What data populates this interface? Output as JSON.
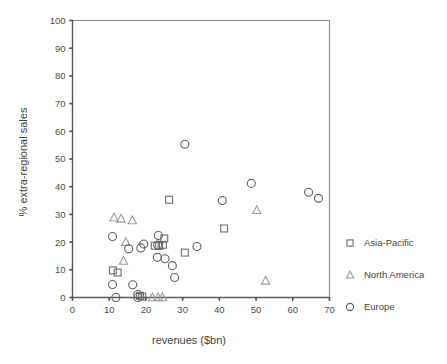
{
  "chart_data": {
    "type": "scatter",
    "title": "",
    "xlabel": "revenues ($bn)",
    "ylabel": "% extra-regional sales",
    "xlim": [
      0,
      70
    ],
    "ylim": [
      0,
      100
    ],
    "xticks": [
      0,
      10,
      20,
      30,
      40,
      50,
      60,
      70
    ],
    "yticks": [
      0,
      10,
      20,
      30,
      40,
      50,
      60,
      70,
      80,
      90,
      100
    ],
    "grid": false,
    "legend_position": "right",
    "series": [
      {
        "name": "Asia-Pacific",
        "marker": "square",
        "points": [
          [
            11.0,
            9.8
          ],
          [
            12.3,
            9.0
          ],
          [
            18.4,
            0.6
          ],
          [
            19.0,
            0.3
          ],
          [
            22.4,
            18.7
          ],
          [
            23.6,
            18.6
          ],
          [
            24.6,
            19.0
          ],
          [
            25.0,
            21.3
          ],
          [
            26.3,
            35.3
          ],
          [
            30.6,
            16.2
          ],
          [
            41.3,
            24.9
          ]
        ]
      },
      {
        "name": "North America",
        "marker": "triangle",
        "points": [
          [
            11.3,
            28.8
          ],
          [
            13.2,
            28.4
          ],
          [
            14.5,
            20.0
          ],
          [
            16.3,
            27.8
          ],
          [
            13.9,
            13.2
          ],
          [
            21.8,
            0.0
          ],
          [
            23.3,
            0.0
          ],
          [
            24.5,
            0.0
          ],
          [
            50.2,
            31.5
          ],
          [
            52.6,
            6.0
          ]
        ]
      },
      {
        "name": "Europe",
        "marker": "circle",
        "points": [
          [
            10.9,
            22.0
          ],
          [
            10.9,
            4.7
          ],
          [
            11.8,
            0.0
          ],
          [
            15.3,
            17.6
          ],
          [
            16.4,
            4.6
          ],
          [
            17.8,
            1.1
          ],
          [
            17.8,
            0.0
          ],
          [
            18.6,
            17.9
          ],
          [
            19.4,
            19.3
          ],
          [
            23.2,
            18.9
          ],
          [
            23.4,
            22.4
          ],
          [
            23.1,
            14.5
          ],
          [
            25.2,
            14.0
          ],
          [
            27.2,
            11.5
          ],
          [
            27.8,
            7.2
          ],
          [
            30.6,
            55.3
          ],
          [
            33.9,
            18.4
          ],
          [
            40.8,
            35.0
          ],
          [
            48.7,
            41.2
          ],
          [
            64.3,
            38.0
          ],
          [
            67.0,
            35.8
          ]
        ]
      }
    ]
  },
  "legend": {
    "entries": [
      {
        "label": "Asia-Pacific",
        "marker": "square"
      },
      {
        "label": "North America",
        "marker": "triangle"
      },
      {
        "label": "Europe",
        "marker": "circle"
      }
    ]
  },
  "axes": {
    "x_title": "revenues ($bn)",
    "y_title": "% extra-regional sales",
    "x_tick_labels": [
      "0",
      "10",
      "20",
      "30",
      "40",
      "50",
      "60",
      "70"
    ],
    "y_tick_labels": [
      "0",
      "10",
      "20",
      "30",
      "40",
      "50",
      "60",
      "70",
      "80",
      "90",
      "100"
    ]
  },
  "colors": {
    "axis": "#5a5a5a",
    "frame": "#8a8a8a",
    "marker_circle": "#5e5e5e",
    "marker_square": "#6b6b6b",
    "marker_triangle": "#9a9a9a",
    "text": "#3f3f3f",
    "background": "#ffffff"
  }
}
